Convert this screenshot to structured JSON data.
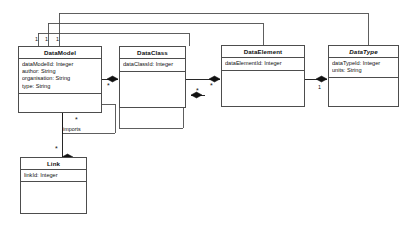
{
  "diagram": {
    "kind": "uml-class-diagram",
    "background": "#ffffff",
    "line_color": "#4d4d4d",
    "text_color": "#111111",
    "classes": [
      {
        "id": "datamodel",
        "name": "DataModel",
        "abstract": false,
        "attributes": [
          "dataModelId: Integer",
          "author: String",
          "organisation: String",
          "type: String"
        ]
      },
      {
        "id": "dataclass",
        "name": "DataClass",
        "abstract": false,
        "attributes": [
          "dataClassId: Integer"
        ]
      },
      {
        "id": "dataelement",
        "name": "DataElement",
        "abstract": false,
        "attributes": [
          "dataElementId: Integer"
        ]
      },
      {
        "id": "datatype",
        "name": "DataType",
        "abstract": true,
        "attributes": [
          "dataTypeId: Integer",
          "units: String"
        ]
      },
      {
        "id": "link",
        "name": "Link",
        "abstract": false,
        "attributes": [
          "linkId: Integer"
        ]
      }
    ],
    "edge_labels": {
      "imports": "imports"
    },
    "multiplicities": {
      "owner_one_a": "1",
      "owner_one_b": "1",
      "owner_one_c": "1",
      "datatype_one": "1",
      "dataclass_many": "*",
      "dataelement_many": "*",
      "dataclass_self_many": "*",
      "link_many": "*",
      "imports_many": "*"
    }
  }
}
